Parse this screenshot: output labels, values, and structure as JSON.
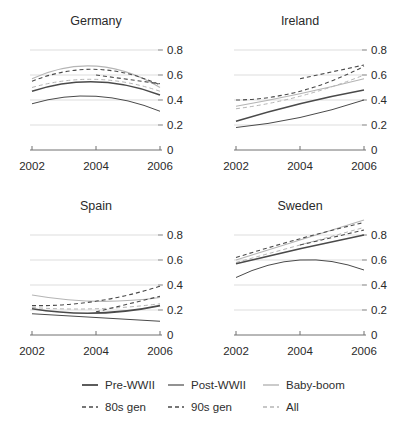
{
  "figure_type": "small-multiples line chart, 2x2 grid of countries with shared legend",
  "colors": {
    "background": "#ffffff",
    "dark_line": "#4a4a4a",
    "light_line": "#b5b5b5",
    "gridline": "#dddddd",
    "axis": "#707070",
    "tick": "#8f8f8f",
    "text": "#2a2a2a"
  },
  "chart_data": [
    {
      "type": "line",
      "title": "Germany",
      "x_ticks": [
        "2002",
        "2004",
        "2006"
      ],
      "x_values": [
        2002,
        2004,
        2006
      ],
      "y_tick_labels": [
        "0",
        "0.2",
        "0.4",
        "0.6",
        "0.8"
      ],
      "y_tick_values": [
        0,
        0.2,
        0.4,
        0.6,
        0.8
      ],
      "ylim": [
        0,
        0.9
      ],
      "grid": "horizontal light gridlines, y labels on right",
      "series": [
        {
          "name": "Baby-boom",
          "tone": "light",
          "style": "solid",
          "width": 1.2,
          "x": [
            2002,
            2004,
            2006
          ],
          "values": [
            0.57,
            0.67,
            0.5
          ]
        },
        {
          "name": "All",
          "tone": "light",
          "style": "dashed",
          "width": 1.0,
          "x": [
            2002,
            2004,
            2006
          ],
          "values": [
            0.5,
            0.565,
            0.47
          ]
        },
        {
          "name": "Pre-WWII",
          "tone": "dark",
          "style": "solid",
          "width": 1.6,
          "x": [
            2002,
            2004,
            2006
          ],
          "values": [
            0.47,
            0.545,
            0.44
          ]
        },
        {
          "name": "Post-WWII",
          "tone": "dark",
          "style": "solid",
          "width": 1.0,
          "x": [
            2002,
            2004,
            2006
          ],
          "values": [
            0.37,
            0.43,
            0.31
          ]
        },
        {
          "name": "80s gen",
          "tone": "dark",
          "style": "dashed",
          "width": 1.1,
          "x": [
            2002,
            2004,
            2006
          ],
          "values": [
            0.55,
            0.645,
            0.52
          ]
        },
        {
          "name": "90s gen",
          "tone": "dark",
          "style": "dashed",
          "width": 1.1,
          "x": [
            2004,
            2006
          ],
          "values": [
            0.6,
            0.53
          ]
        }
      ]
    },
    {
      "type": "line",
      "title": "Ireland",
      "x_ticks": [
        "2002",
        "2004",
        "2006"
      ],
      "x_values": [
        2002,
        2004,
        2006
      ],
      "y_tick_labels": [
        "0",
        "0.2",
        "0.4",
        "0.6",
        "0.8"
      ],
      "y_tick_values": [
        0,
        0.2,
        0.4,
        0.6,
        0.8
      ],
      "ylim": [
        0,
        0.9
      ],
      "grid": "horizontal light gridlines, y labels on right",
      "series": [
        {
          "name": "Baby-boom",
          "tone": "light",
          "style": "solid",
          "width": 1.2,
          "x": [
            2002,
            2004,
            2006
          ],
          "values": [
            0.35,
            0.45,
            0.57
          ]
        },
        {
          "name": "All",
          "tone": "light",
          "style": "dashed",
          "width": 1.0,
          "x": [
            2002,
            2004,
            2006
          ],
          "values": [
            0.33,
            0.43,
            0.6
          ]
        },
        {
          "name": "Pre-WWII",
          "tone": "dark",
          "style": "solid",
          "width": 1.6,
          "x": [
            2002,
            2004,
            2006
          ],
          "values": [
            0.23,
            0.37,
            0.48
          ]
        },
        {
          "name": "Post-WWII",
          "tone": "dark",
          "style": "solid",
          "width": 1.0,
          "x": [
            2002,
            2004,
            2006
          ],
          "values": [
            0.18,
            0.26,
            0.4
          ]
        },
        {
          "name": "80s gen",
          "tone": "dark",
          "style": "dashed",
          "width": 1.1,
          "x": [
            2002,
            2004,
            2006
          ],
          "values": [
            0.4,
            0.47,
            0.67
          ]
        },
        {
          "name": "90s gen",
          "tone": "dark",
          "style": "dashed",
          "width": 1.1,
          "x": [
            2004,
            2006
          ],
          "values": [
            0.57,
            0.68
          ]
        }
      ]
    },
    {
      "type": "line",
      "title": "Spain",
      "x_ticks": [
        "2002",
        "2004",
        "2006"
      ],
      "x_values": [
        2002,
        2004,
        2006
      ],
      "y_tick_labels": [
        "0",
        "0.2",
        "0.4",
        "0.6",
        "0.8"
      ],
      "y_tick_values": [
        0,
        0.2,
        0.4,
        0.6,
        0.8
      ],
      "ylim": [
        0,
        0.9
      ],
      "grid": "horizontal light gridlines, y labels on right",
      "series": [
        {
          "name": "Baby-boom",
          "tone": "light",
          "style": "solid",
          "width": 1.2,
          "x": [
            2002,
            2004,
            2006
          ],
          "values": [
            0.32,
            0.27,
            0.3
          ]
        },
        {
          "name": "All",
          "tone": "light",
          "style": "dashed",
          "width": 1.0,
          "x": [
            2002,
            2004,
            2006
          ],
          "values": [
            0.22,
            0.21,
            0.25
          ]
        },
        {
          "name": "Pre-WWII",
          "tone": "dark",
          "style": "solid",
          "width": 1.6,
          "x": [
            2002,
            2004,
            2006
          ],
          "values": [
            0.21,
            0.175,
            0.235
          ]
        },
        {
          "name": "Post-WWII",
          "tone": "dark",
          "style": "solid",
          "width": 1.0,
          "x": [
            2002,
            2004,
            2006
          ],
          "values": [
            0.17,
            0.14,
            0.11
          ]
        },
        {
          "name": "80s gen",
          "tone": "dark",
          "style": "dashed",
          "width": 1.1,
          "x": [
            2002,
            2004,
            2006
          ],
          "values": [
            0.235,
            0.27,
            0.39
          ]
        },
        {
          "name": "90s gen",
          "tone": "dark",
          "style": "dashed",
          "width": 1.1,
          "x": [
            2004,
            2006
          ],
          "values": [
            0.185,
            0.31
          ]
        }
      ]
    },
    {
      "type": "line",
      "title": "Sweden",
      "x_ticks": [
        "2002",
        "2004",
        "2006"
      ],
      "x_values": [
        2002,
        2004,
        2006
      ],
      "y_tick_labels": [
        "0",
        "0.2",
        "0.4",
        "0.6",
        "0.8"
      ],
      "y_tick_values": [
        0,
        0.2,
        0.4,
        0.6,
        0.8
      ],
      "ylim": [
        0,
        0.95
      ],
      "grid": "horizontal light gridlines, y labels on right",
      "series": [
        {
          "name": "Baby-boom",
          "tone": "light",
          "style": "solid",
          "width": 1.2,
          "x": [
            2002,
            2004,
            2006
          ],
          "values": [
            0.6,
            0.76,
            0.92
          ]
        },
        {
          "name": "All",
          "tone": "light",
          "style": "dashed",
          "width": 1.0,
          "x": [
            2002,
            2004,
            2006
          ],
          "values": [
            0.58,
            0.72,
            0.86
          ]
        },
        {
          "name": "Pre-WWII",
          "tone": "dark",
          "style": "solid",
          "width": 1.6,
          "x": [
            2002,
            2004,
            2006
          ],
          "values": [
            0.57,
            0.69,
            0.8
          ]
        },
        {
          "name": "Post-WWII",
          "tone": "dark",
          "style": "solid",
          "width": 1.0,
          "x": [
            2002,
            2004,
            2006
          ],
          "values": [
            0.46,
            0.6,
            0.52
          ]
        },
        {
          "name": "80s gen",
          "tone": "dark",
          "style": "dashed",
          "width": 1.1,
          "x": [
            2002,
            2004,
            2006
          ],
          "values": [
            0.62,
            0.77,
            0.9
          ]
        },
        {
          "name": "90s gen",
          "tone": "dark",
          "style": "dashed",
          "width": 1.1,
          "x": [
            2004,
            2006
          ],
          "values": [
            0.72,
            0.84
          ]
        }
      ]
    }
  ],
  "legend": {
    "position": "bottom",
    "items": [
      {
        "label": "Pre-WWII",
        "tone": "dark",
        "style": "solid",
        "width": 1.8
      },
      {
        "label": "Post-WWII",
        "tone": "dark",
        "style": "solid",
        "width": 1.2
      },
      {
        "label": "Baby-boom",
        "tone": "light",
        "style": "solid",
        "width": 1.4
      },
      {
        "label": "80s gen",
        "tone": "dark",
        "style": "dashed",
        "width": 1.3
      },
      {
        "label": "90s gen",
        "tone": "dark",
        "style": "dashed",
        "width": 1.3
      },
      {
        "label": "All",
        "tone": "light",
        "style": "dashed",
        "width": 1.3
      }
    ]
  }
}
